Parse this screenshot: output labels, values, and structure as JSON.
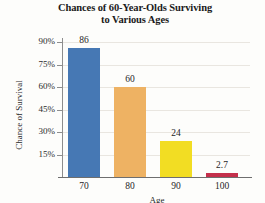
{
  "chart_data": {
    "type": "bar",
    "title": "Chances of 60-Year-Olds Surviving to Various Ages",
    "title_lines": [
      "Chances of 60-Year-Olds Surviving",
      "to Various Ages"
    ],
    "categories": [
      "70",
      "80",
      "90",
      "100"
    ],
    "values": [
      86,
      60,
      24,
      2.7
    ],
    "value_labels": [
      "86",
      "60",
      "24",
      "2.7"
    ],
    "xlabel": "Age",
    "ylabel": "Chance of Survival",
    "ytick_labels": [
      "90%",
      "75%",
      "60%",
      "45%",
      "30%",
      "15%"
    ],
    "ytick_values": [
      90,
      75,
      60,
      45,
      30,
      15
    ],
    "ylim": [
      0,
      97
    ],
    "grid": true,
    "legend": "none",
    "bar_colors": [
      "#4678b4",
      "#eeb263",
      "#f2dd23",
      "#c4304b"
    ],
    "grid_color": "#e9e6e0",
    "axis_color": "#7d7d7d",
    "background": "#fdfdfb"
  }
}
